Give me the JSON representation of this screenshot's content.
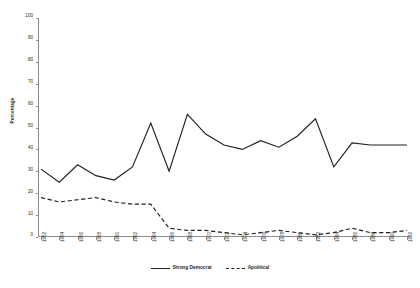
{
  "chart_data": {
    "type": "line",
    "title": "",
    "xlabel": "",
    "ylabel": "Percentage",
    "ylim": [
      0,
      100
    ],
    "ytick_step": 10,
    "yticks": [
      0,
      10,
      20,
      30,
      40,
      50,
      60,
      70,
      80,
      90,
      100
    ],
    "grid": false,
    "legend_position": "bottom-center",
    "categories": [
      "1952",
      "1954",
      "1956",
      "1958",
      "1960",
      "1962",
      "1964",
      "1966",
      "1968",
      "1970",
      "1972",
      "1974",
      "1976",
      "1978",
      "1980",
      "1982",
      "1984",
      "1986",
      "1988",
      "1990",
      "1992"
    ],
    "series": [
      {
        "name": "Strong Democrat",
        "style": "solid",
        "color": "#231f20",
        "values": [
          31,
          25,
          33,
          28,
          26,
          32,
          52,
          30,
          56,
          47,
          42,
          40,
          44,
          41,
          46,
          54,
          32,
          43,
          42,
          42,
          42
        ]
      },
      {
        "name": "Apolitical",
        "style": "dashed",
        "color": "#231f20",
        "values": [
          18,
          16,
          17,
          18,
          16,
          15,
          15,
          4,
          3,
          3,
          2,
          1,
          2,
          3,
          2,
          1,
          2,
          4,
          2,
          2,
          3
        ]
      }
    ]
  },
  "axes": {
    "y_title": "Percentage"
  },
  "legend": {
    "items": [
      {
        "label": "Strong Democrat",
        "style": "solid"
      },
      {
        "label": "Apolitical",
        "style": "dashed"
      }
    ]
  }
}
